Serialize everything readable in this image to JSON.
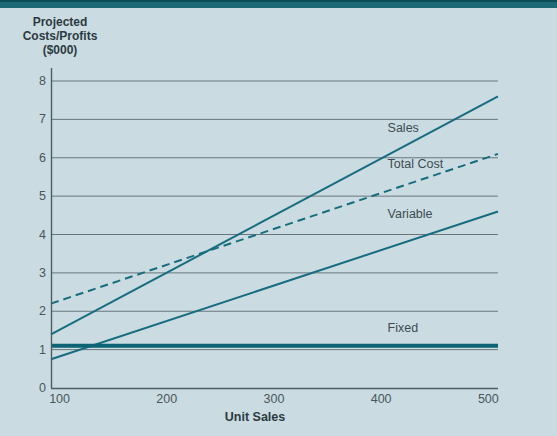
{
  "page": {
    "background": "#cadce1",
    "top_bar_color": "#1a6b76",
    "top_bar_edge_color": "#0b4d57"
  },
  "colors": {
    "line_teal": "#176c7e",
    "fixed_teal": "#0c6375",
    "grid": "#68777d",
    "axis": "#4e5d64",
    "tick_text": "#47565c",
    "label_text": "#3c4b52",
    "title_text": "#2c3a41"
  },
  "axis": {
    "y_title_lines": [
      "Projected",
      "Costs/Profits",
      "($000)"
    ],
    "x_title": "Unit Sales"
  },
  "chart_data": {
    "type": "line",
    "title": "",
    "xlabel": "Unit Sales",
    "ylabel": "Projected Costs/Profits ($000)",
    "x_ticks": [
      100,
      200,
      300,
      400,
      500
    ],
    "y_ticks": [
      0,
      1,
      2,
      3,
      4,
      5,
      6,
      7,
      8
    ],
    "xlim": [
      92,
      509
    ],
    "ylim": [
      0,
      8
    ],
    "grid": "horizontal-only",
    "legend": "inline-labels-on-plot",
    "series": [
      {
        "name": "Sales",
        "style": "solid",
        "width": 2,
        "color": "#176c7e",
        "x": [
          92,
          509
        ],
        "values": [
          1.4,
          7.6
        ],
        "label": "Sales",
        "label_pos": {
          "x": 406,
          "y": 6.75
        }
      },
      {
        "name": "Total Cost",
        "style": "dashed",
        "width": 2,
        "color": "#176c7e",
        "x": [
          92,
          509
        ],
        "values": [
          2.2,
          6.1
        ],
        "label": "Total Cost",
        "label_pos": {
          "x": 406,
          "y": 5.8
        }
      },
      {
        "name": "Variable",
        "style": "solid",
        "width": 2,
        "color": "#176c7e",
        "x": [
          92,
          509
        ],
        "values": [
          0.75,
          4.6
        ],
        "label": "Variable",
        "label_pos": {
          "x": 406,
          "y": 4.5
        }
      },
      {
        "name": "Fixed",
        "style": "solid",
        "width": 4,
        "color": "#0c6375",
        "x": [
          92,
          509
        ],
        "values": [
          1.1,
          1.1
        ],
        "label": "Fixed",
        "label_pos": {
          "x": 406,
          "y": 1.55
        }
      }
    ]
  }
}
